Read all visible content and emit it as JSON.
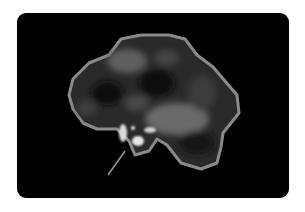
{
  "image": {
    "description": "Grayscale brain scan image on black rounded panel",
    "colors": {
      "background": "#ffffff",
      "panel": "#000000",
      "outline": "#8a8a8a",
      "highlight": "#e0e0e0"
    }
  }
}
